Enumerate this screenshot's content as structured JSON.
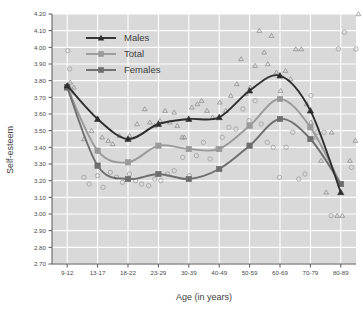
{
  "figure": {
    "title_cut_off": "",
    "background_color": "#ffffff",
    "plot_background_color": "#d9d9d9",
    "gridline_color": "#ffffff"
  },
  "axes": {
    "ylabel": "Self-esteem",
    "xlabel": "Age (in years)",
    "yticks": [
      "2.70",
      "2.80",
      "2.90",
      "3.00",
      "3.10",
      "3.20",
      "3.30",
      "3.40",
      "3.50",
      "3.60",
      "3.70",
      "3.80",
      "3.90",
      "4.00",
      "4.10",
      "4.20"
    ],
    "xticks": [
      "9-12",
      "13-17",
      "18-22",
      "23-29",
      "30-39",
      "40-49",
      "50-59",
      "60-69",
      "70-79",
      "80-89"
    ]
  },
  "legend": {
    "position": "upper-left-inside",
    "entries": [
      {
        "label": "Males",
        "color": "#2e2e2e",
        "marker": "triangle"
      },
      {
        "label": "Total",
        "color": "#9a9a9a",
        "marker": "square"
      },
      {
        "label": "Females",
        "color": "#6e6e6e",
        "marker": "square"
      }
    ]
  },
  "chart_data": {
    "type": "line",
    "title": "",
    "xlabel": "Age (in years)",
    "ylabel": "Self-esteem",
    "ylim": [
      2.7,
      4.2
    ],
    "grid": true,
    "legend_position": "upper-left-inside",
    "categories": [
      "9-12",
      "13-17",
      "18-22",
      "23-29",
      "30-39",
      "40-49",
      "50-59",
      "60-69",
      "70-79",
      "80-89"
    ],
    "series": [
      {
        "name": "Males",
        "color": "#2e2e2e",
        "marker": "triangle",
        "values": [
          3.77,
          3.57,
          3.45,
          3.54,
          3.57,
          3.58,
          3.74,
          3.83,
          3.62,
          3.13
        ]
      },
      {
        "name": "Total",
        "color": "#9a9a9a",
        "marker": "square",
        "values": [
          3.76,
          3.38,
          3.31,
          3.41,
          3.39,
          3.39,
          3.53,
          3.69,
          3.52,
          3.18
        ]
      },
      {
        "name": "Females",
        "color": "#6e6e6e",
        "marker": "square",
        "values": [
          3.76,
          3.29,
          3.21,
          3.24,
          3.21,
          3.27,
          3.41,
          3.57,
          3.45,
          3.18
        ]
      }
    ],
    "scatter": {
      "males_marker": "open-triangle",
      "females_marker": "open-circle",
      "males_points": [
        [
          0.1,
          3.79
        ],
        [
          0.18,
          3.73
        ],
        [
          0.22,
          3.76
        ],
        [
          0.55,
          3.45
        ],
        [
          0.8,
          3.5
        ],
        [
          1.15,
          3.46
        ],
        [
          1.35,
          3.44
        ],
        [
          1.5,
          3.42
        ],
        [
          1.72,
          3.47
        ],
        [
          2.05,
          3.47
        ],
        [
          2.3,
          3.54
        ],
        [
          2.55,
          3.63
        ],
        [
          2.72,
          3.55
        ],
        [
          2.88,
          3.53
        ],
        [
          3.05,
          3.56
        ],
        [
          3.22,
          3.62
        ],
        [
          3.38,
          3.55
        ],
        [
          3.52,
          3.61
        ],
        [
          3.62,
          3.53
        ],
        [
          3.78,
          3.46
        ],
        [
          3.85,
          3.46
        ],
        [
          4.1,
          3.64
        ],
        [
          4.28,
          3.66
        ],
        [
          4.42,
          3.68
        ],
        [
          4.6,
          3.62
        ],
        [
          4.78,
          3.58
        ],
        [
          5.02,
          3.67
        ],
        [
          5.22,
          3.62
        ],
        [
          5.38,
          3.71
        ],
        [
          5.58,
          3.78
        ],
        [
          5.72,
          3.93
        ],
        [
          5.88,
          3.72
        ],
        [
          6.02,
          3.76
        ],
        [
          6.18,
          3.89
        ],
        [
          6.32,
          4.1
        ],
        [
          6.48,
          3.97
        ],
        [
          6.6,
          3.9
        ],
        [
          6.72,
          4.07
        ],
        [
          6.88,
          3.85
        ],
        [
          7.02,
          3.74
        ],
        [
          7.18,
          3.86
        ],
        [
          7.35,
          3.81
        ],
        [
          7.52,
          3.99
        ],
        [
          7.7,
          3.99
        ],
        [
          7.88,
          3.66
        ],
        [
          8.02,
          3.55
        ],
        [
          8.18,
          3.46
        ],
        [
          8.35,
          3.32
        ],
        [
          8.52,
          3.13
        ],
        [
          8.7,
          3.49
        ],
        [
          8.88,
          2.99
        ],
        [
          9.05,
          2.99
        ],
        [
          9.3,
          3.32
        ],
        [
          9.48,
          3.44
        ],
        [
          9.58,
          4.2
        ]
      ],
      "females_points": [
        [
          0.02,
          3.98
        ],
        [
          0.08,
          3.87
        ],
        [
          0.12,
          3.75
        ],
        [
          0.55,
          3.22
        ],
        [
          0.72,
          3.18
        ],
        [
          1.0,
          3.23
        ],
        [
          1.18,
          3.16
        ],
        [
          1.42,
          3.25
        ],
        [
          1.62,
          3.22
        ],
        [
          1.82,
          3.19
        ],
        [
          2.05,
          3.24
        ],
        [
          2.25,
          3.2
        ],
        [
          2.45,
          3.18
        ],
        [
          2.68,
          3.17
        ],
        [
          2.88,
          3.21
        ],
        [
          3.08,
          3.2
        ],
        [
          3.3,
          3.24
        ],
        [
          3.52,
          3.26
        ],
        [
          3.8,
          3.34
        ],
        [
          4.02,
          3.23
        ],
        [
          4.25,
          3.35
        ],
        [
          4.48,
          3.43
        ],
        [
          4.7,
          3.33
        ],
        [
          4.92,
          3.39
        ],
        [
          5.1,
          3.46
        ],
        [
          5.32,
          3.52
        ],
        [
          5.55,
          3.51
        ],
        [
          5.78,
          3.63
        ],
        [
          5.98,
          3.56
        ],
        [
          6.18,
          3.68
        ],
        [
          6.38,
          3.54
        ],
        [
          6.58,
          3.43
        ],
        [
          6.78,
          3.4
        ],
        [
          6.98,
          3.22
        ],
        [
          7.2,
          3.4
        ],
        [
          7.42,
          3.49
        ],
        [
          7.62,
          3.21
        ],
        [
          7.82,
          3.24
        ],
        [
          8.02,
          3.71
        ],
        [
          8.22,
          3.49
        ],
        [
          8.45,
          3.49
        ],
        [
          8.68,
          2.99
        ],
        [
          8.92,
          3.99
        ],
        [
          9.12,
          4.09
        ],
        [
          9.35,
          3.28
        ],
        [
          9.5,
          3.99
        ]
      ]
    }
  }
}
